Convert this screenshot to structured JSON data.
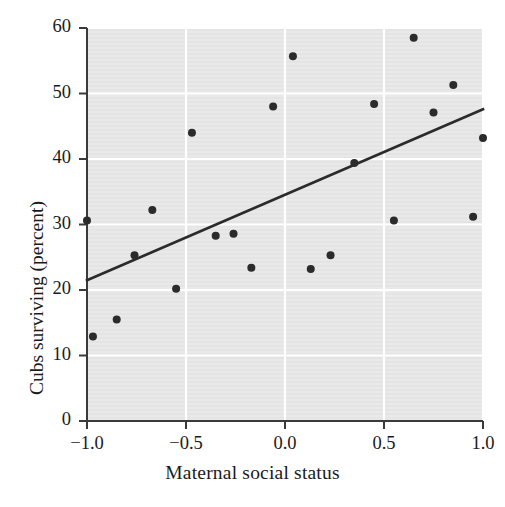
{
  "chart_data": {
    "type": "scatter",
    "title": "",
    "xlabel": "Maternal social status",
    "ylabel": "Cubs surviving (percent)",
    "xlim": [
      -1.0,
      1.0
    ],
    "ylim": [
      0,
      60
    ],
    "xticks": [
      "-1.0",
      "-0.5",
      "0.0",
      "0.5",
      "1.0"
    ],
    "xtick_values": [
      -1.0,
      -0.5,
      0.0,
      0.5,
      1.0
    ],
    "yticks": [
      "0",
      "10",
      "20",
      "30",
      "40",
      "50",
      "60"
    ],
    "ytick_values": [
      0,
      10,
      20,
      30,
      40,
      50,
      60
    ],
    "grid": true,
    "grid_color": "#ffffff",
    "plot_background": "#e8e8e8",
    "legend": null,
    "marker_color": "#2b2b2b",
    "marker_size": 7,
    "points": [
      {
        "x": -1.0,
        "y": 30.6
      },
      {
        "x": -0.97,
        "y": 12.9
      },
      {
        "x": -0.85,
        "y": 15.5
      },
      {
        "x": -0.76,
        "y": 25.3
      },
      {
        "x": -0.67,
        "y": 32.2
      },
      {
        "x": -0.55,
        "y": 20.2
      },
      {
        "x": -0.47,
        "y": 44.0
      },
      {
        "x": -0.35,
        "y": 28.3
      },
      {
        "x": -0.26,
        "y": 28.6
      },
      {
        "x": -0.17,
        "y": 23.4
      },
      {
        "x": -0.06,
        "y": 48.0
      },
      {
        "x": 0.04,
        "y": 55.7
      },
      {
        "x": 0.13,
        "y": 23.2
      },
      {
        "x": 0.23,
        "y": 25.3
      },
      {
        "x": 0.35,
        "y": 39.4
      },
      {
        "x": 0.45,
        "y": 48.4
      },
      {
        "x": 0.55,
        "y": 30.6
      },
      {
        "x": 0.65,
        "y": 58.5
      },
      {
        "x": 0.75,
        "y": 47.1
      },
      {
        "x": 0.85,
        "y": 51.3
      },
      {
        "x": 0.95,
        "y": 31.2
      },
      {
        "x": 1.0,
        "y": 43.2
      }
    ],
    "trendline": {
      "type": "linear-regression",
      "color": "#2b2b2b",
      "x_start": -1.0,
      "y_start": 21.5,
      "x_end": 1.0,
      "y_end": 47.6
    }
  }
}
